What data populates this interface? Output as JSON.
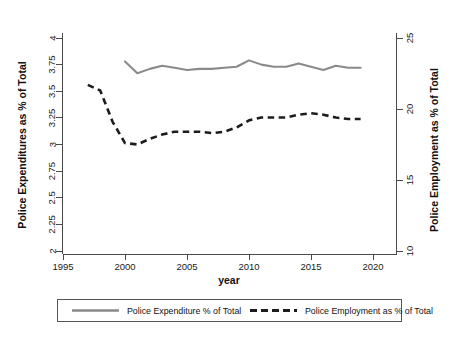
{
  "chart_data": {
    "type": "line",
    "title": "",
    "xlabel": "year",
    "ylabel": "Police Expenditures as % of Total",
    "y2label": "Police Employment as % of Total",
    "xlim": [
      1994.2,
      2021.6
    ],
    "ylim": [
      2,
      4
    ],
    "y2lim": [
      10,
      25
    ],
    "grid": false,
    "legend_position": "bottom",
    "xticks": [
      1995,
      2000,
      2005,
      2010,
      2015,
      2020
    ],
    "xtick_labels": [
      "1995",
      "2000",
      "2005",
      "2010",
      "2015",
      "2020"
    ],
    "yticks": [
      2,
      2.25,
      2.5,
      2.75,
      3,
      3.25,
      3.5,
      3.75,
      4
    ],
    "ytick_labels": [
      "2",
      "2.25",
      "2.5",
      "2.75",
      "3",
      "3.25",
      "3.5",
      "3.75",
      "4"
    ],
    "y2ticks": [
      10,
      15,
      20,
      25
    ],
    "y2tick_labels": [
      "10",
      "15",
      "20",
      "25"
    ],
    "series": [
      {
        "name": "Police Expenditure % of Total",
        "style": "solid",
        "color": "#8a8a8a",
        "axis": "left",
        "x": [
          2000,
          2001,
          2002,
          2003,
          2004,
          2005,
          2006,
          2007,
          2008,
          2009,
          2010,
          2011,
          2012,
          2013,
          2014,
          2015,
          2016,
          2017,
          2018,
          2019
        ],
        "values": [
          3.78,
          3.67,
          3.71,
          3.74,
          3.72,
          3.7,
          3.71,
          3.71,
          3.72,
          3.73,
          3.79,
          3.75,
          3.73,
          3.73,
          3.76,
          3.73,
          3.7,
          3.74,
          3.72,
          3.72
        ]
      },
      {
        "name": "Police Employment as % of Total",
        "style": "dashed",
        "color": "#1c1c1c",
        "axis": "right",
        "x": [
          1997,
          1998,
          1999,
          2000,
          2001,
          2002,
          2003,
          2004,
          2005,
          2006,
          2007,
          2008,
          2009,
          2010,
          2011,
          2012,
          2013,
          2014,
          2015,
          2016,
          2017,
          2018,
          2019
        ],
        "values": [
          21.7,
          21.3,
          19.1,
          17.6,
          17.5,
          17.9,
          18.2,
          18.4,
          18.4,
          18.4,
          18.3,
          18.4,
          18.7,
          19.2,
          19.4,
          19.4,
          19.4,
          19.6,
          19.7,
          19.6,
          19.4,
          19.3,
          19.3
        ]
      }
    ]
  },
  "axes": {
    "left_title": "Police Expenditures as % of Total",
    "right_title": "Police Employment as % of Total",
    "x_title": "year"
  },
  "legend": {
    "entries": [
      {
        "label": "Police Expenditure % of Total",
        "swatch": "solid-line-swatch"
      },
      {
        "label": "Police Employment as % of Total",
        "swatch": "dashed-line-swatch"
      }
    ]
  },
  "colors": {
    "solid_series": "#8a8a8a",
    "dashed_series": "#1c1c1c",
    "axis": "#4a4a4a",
    "text": "#111111",
    "background": "#ffffff"
  }
}
